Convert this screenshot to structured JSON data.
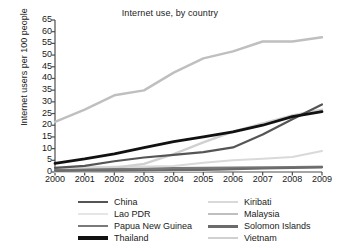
{
  "chart_data": {
    "type": "line",
    "title": "Internet use, by country",
    "xlabel": "",
    "ylabel": "Internet users per 100 people",
    "x": [
      2000,
      2001,
      2002,
      2003,
      2004,
      2005,
      2006,
      2007,
      2008,
      2009
    ],
    "xtick_labels": [
      "2000",
      "2001",
      "2002",
      "2003",
      "2004",
      "2005",
      "2006",
      "2007",
      "2008",
      "2009"
    ],
    "ytick_labels": [
      "0",
      "5",
      "10",
      "15",
      "20",
      "25",
      "30",
      "35",
      "40",
      "45",
      "50",
      "55",
      "60",
      "65"
    ],
    "ylim": [
      0,
      65
    ],
    "xlim": [
      2000,
      2009
    ],
    "grid": false,
    "legend_position": "bottom",
    "series": [
      {
        "name": "China",
        "color": "#555555",
        "width": 2.2,
        "values": [
          1.8,
          2.6,
          4.6,
          6.2,
          7.3,
          8.5,
          10.5,
          16.0,
          22.6,
          28.9
        ]
      },
      {
        "name": "Kiribati",
        "color": "#d9d9d9",
        "width": 2.0,
        "values": [
          1.8,
          2.0,
          2.2,
          2.4,
          2.6,
          4.0,
          5.0,
          5.7,
          6.4,
          9.0
        ]
      },
      {
        "name": "Lao PDR",
        "color": "#e6e6e6",
        "width": 2.0,
        "values": [
          0.1,
          0.2,
          0.3,
          0.4,
          0.4,
          0.5,
          1.2,
          1.6,
          2.1,
          2.5
        ]
      },
      {
        "name": "Malaysia",
        "color": "#bfbfbf",
        "width": 2.4,
        "values": [
          21.4,
          26.7,
          32.8,
          34.9,
          42.5,
          48.6,
          51.6,
          55.8,
          55.8,
          57.6
        ]
      },
      {
        "name": "Papua New Guinea",
        "color": "#7a7a7a",
        "width": 2.2,
        "values": [
          0.8,
          1.0,
          1.2,
          1.4,
          1.7,
          1.8,
          1.9,
          2.0,
          2.1,
          2.2
        ]
      },
      {
        "name": "Solomon Islands",
        "color": "#6b6b6b",
        "width": 2.2,
        "values": [
          0.5,
          0.6,
          0.6,
          0.7,
          0.8,
          0.9,
          1.2,
          1.5,
          1.8,
          2.0
        ]
      },
      {
        "name": "Thailand",
        "color": "#111111",
        "width": 2.8,
        "values": [
          3.7,
          5.6,
          7.8,
          10.4,
          13.0,
          15.0,
          17.2,
          20.0,
          23.7,
          25.8
        ]
      },
      {
        "name": "Vietnam",
        "color": "#d0d0d0",
        "width": 2.4,
        "values": [
          0.3,
          1.0,
          1.8,
          3.5,
          7.6,
          12.7,
          17.3,
          20.8,
          24.2,
          26.6
        ]
      }
    ]
  },
  "legend": {
    "columns": [
      [
        {
          "label": "China",
          "color": "#555555",
          "width": 2.4
        },
        {
          "label": "Lao PDR",
          "color": "#e6e6e6",
          "width": 2.4
        },
        {
          "label": "Papua New Guinea",
          "color": "#7a7a7a",
          "width": 2.6
        },
        {
          "label": "Thailand",
          "color": "#111111",
          "width": 3.2
        }
      ],
      [
        {
          "label": "Kiribati",
          "color": "#d9d9d9",
          "width": 2.4
        },
        {
          "label": "Malaysia",
          "color": "#bfbfbf",
          "width": 2.6
        },
        {
          "label": "Solomon Islands",
          "color": "#6b6b6b",
          "width": 3.0
        },
        {
          "label": "Vietnam",
          "color": "#d0d0d0",
          "width": 2.4
        }
      ]
    ]
  },
  "axis": {
    "line_color": "#4d4d4d"
  }
}
